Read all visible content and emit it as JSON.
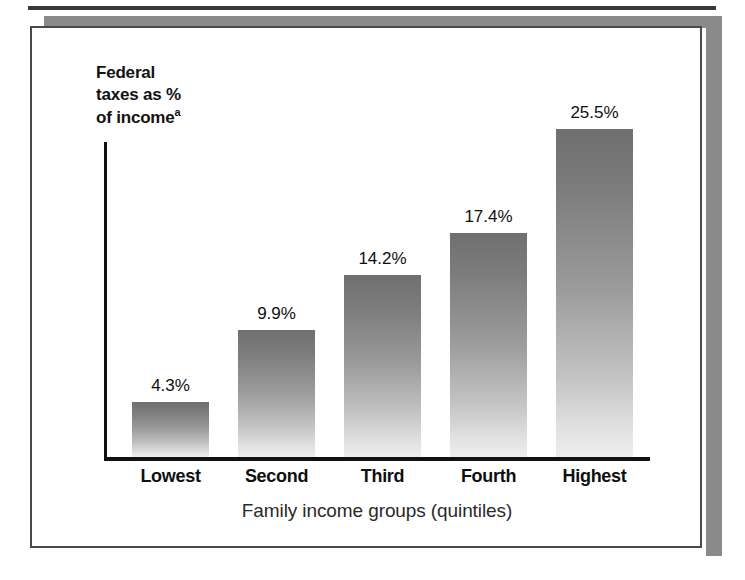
{
  "chart_data": {
    "type": "bar",
    "title": "",
    "categories": [
      "Lowest",
      "Second",
      "Third",
      "Fourth",
      "Highest"
    ],
    "values": [
      4.3,
      9.9,
      14.2,
      17.4,
      25.5
    ],
    "value_labels": [
      "4.3%",
      "9.9%",
      "14.2%",
      "17.4%",
      "25.5%"
    ],
    "ylabel": "Federal\ntaxes as %\nof income",
    "ylabel_footnote": "a",
    "xlabel": "Family income groups (quintiles)",
    "ylim": [
      0,
      27
    ],
    "grid": false,
    "legend": false,
    "bar_color_top": "#6f6f6f",
    "bar_color_bottom": "#eeeeee",
    "axis_color": "#111111",
    "text_color": "#0f0f0f"
  },
  "frame": {
    "background": "#ffffff",
    "shadow_color": "#8a8a8a",
    "border_color": "#4a4a4a"
  }
}
